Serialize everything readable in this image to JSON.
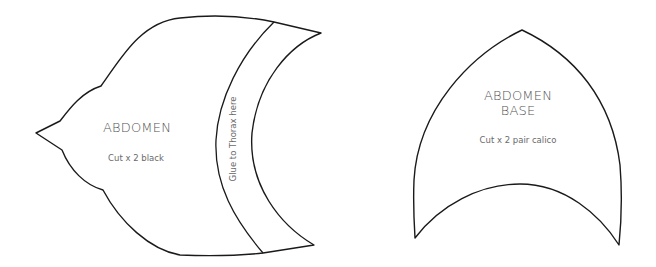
{
  "pieces": [
    {
      "name": "abdomen",
      "title": "ABDOMEN",
      "instruction": "Cut x 2 black",
      "band_label": "Glue to Thorax here"
    },
    {
      "name": "abdomen-base",
      "title_line1": "ABDOMEN",
      "title_line2": "BASE",
      "instruction": "Cut x 2 pair calico"
    }
  ],
  "colors": {
    "outline": "#1a1a1a",
    "text": "#5a5a5a",
    "background": "#ffffff"
  }
}
